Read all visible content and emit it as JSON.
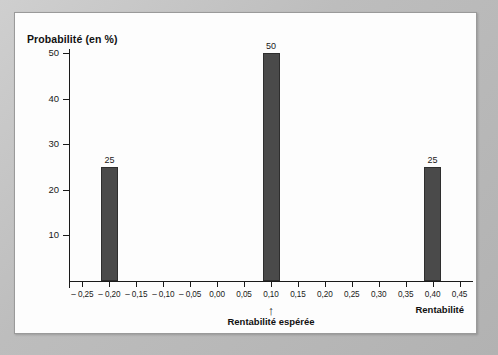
{
  "chart_data": {
    "type": "bar",
    "title": "",
    "ylabel": "Probabilité (en %)",
    "xlabel": "Rentabilité",
    "ylim": [
      0,
      50
    ],
    "xlim": [
      -0.275,
      0.475
    ],
    "grid": false,
    "legend": null,
    "y_ticks": [
      10,
      20,
      30,
      40,
      50
    ],
    "y_tick_labels": [
      "10",
      "20",
      "30",
      "40",
      "50"
    ],
    "x_tick_labels": [
      "– 0,25",
      "– 0,20",
      "– 0,15",
      "– 0,10",
      "– 0,05",
      "0,00",
      "0,05",
      "0,10",
      "0,15",
      "0,20",
      "0,25",
      "0,30",
      "0,35",
      "0,40",
      "0,45"
    ],
    "x_tick_values": [
      -0.25,
      -0.2,
      -0.15,
      -0.1,
      -0.05,
      0.0,
      0.05,
      0.1,
      0.15,
      0.2,
      0.25,
      0.3,
      0.35,
      0.4,
      0.45
    ],
    "categories": [
      -0.2,
      0.1,
      0.4
    ],
    "values": [
      25,
      50,
      25
    ],
    "bar_labels": [
      "25",
      "50",
      "25"
    ],
    "bar_color": "#4a4a4a",
    "bar_edge_color": "#2e2e2e",
    "annotations": [
      {
        "name": "expected-return",
        "label": "Rentabilité espérée",
        "arrow": "↑",
        "x": 0.1
      }
    ]
  },
  "figure": {
    "frame_color": "#bdbdbd",
    "panel_color": "#fdfdfd"
  }
}
